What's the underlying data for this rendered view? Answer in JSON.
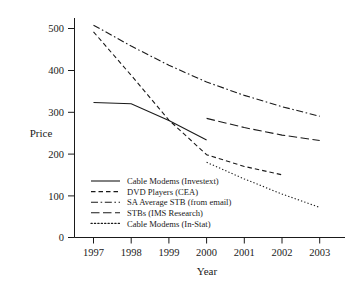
{
  "chart_data": {
    "type": "line",
    "title": "",
    "xlabel": "Year",
    "ylabel": "Price",
    "x": [
      1997,
      1998,
      1999,
      2000,
      2001,
      2002,
      2003
    ],
    "xtick_labels": [
      "1997",
      "1998",
      "1999",
      "2000",
      "2001",
      "2002",
      "2003"
    ],
    "ytick_labels": [
      "0",
      "100",
      "200",
      "300",
      "400",
      "500"
    ],
    "ytick_values": [
      0,
      100,
      200,
      300,
      400,
      500
    ],
    "xlim": [
      1996.6,
      2003.5
    ],
    "ylim": [
      0,
      540
    ],
    "grid": false,
    "legend_position": "lower-left-inside",
    "series": [
      {
        "name": "Cable Modems (Investext)",
        "style": "solid",
        "x": [
          1997,
          1998,
          1999,
          2000
        ],
        "values": [
          323,
          320,
          280,
          233
        ]
      },
      {
        "name": "DVD Players (CEA)",
        "style": "dashed",
        "x": [
          1997,
          1998,
          1999,
          2000,
          2001,
          2002
        ],
        "values": [
          492,
          388,
          281,
          198,
          170,
          150
        ]
      },
      {
        "name": "SA Average STB (from email)",
        "style": "dash-dot",
        "x": [
          1997,
          1998,
          1999,
          2000,
          2001,
          2002,
          2003
        ],
        "values": [
          508,
          458,
          412,
          372,
          340,
          313,
          290
        ]
      },
      {
        "name": "STBs (IMS Research)",
        "style": "long-dash",
        "x": [
          2000,
          2001,
          2002,
          2003
        ],
        "values": [
          285,
          263,
          245,
          232
        ]
      },
      {
        "name": "Cable Modems (In-Stat)",
        "style": "dotted",
        "x": [
          2000,
          2001,
          2002,
          2003
        ],
        "values": [
          180,
          140,
          104,
          72
        ]
      }
    ]
  },
  "legend": {
    "entries": [
      {
        "label": "Cable Modems (Investext)",
        "style": "solid"
      },
      {
        "label": "DVD Players (CEA)",
        "style": "dashed"
      },
      {
        "label": "SA Average STB (from email)",
        "style": "dash-dot"
      },
      {
        "label": "STBs (IMS Research)",
        "style": "long-dash"
      },
      {
        "label": "Cable Modems (In-Stat)",
        "style": "dotted"
      }
    ]
  },
  "colors": {
    "ink": "#1a1a1a",
    "background": "#ffffff"
  }
}
